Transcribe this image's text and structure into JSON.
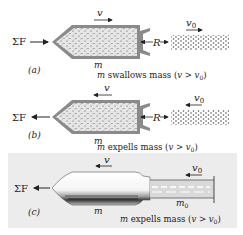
{
  "panels": [
    {
      "id": "a",
      "label": "(a)",
      "force_label": "ΣF",
      "force_direction": "right",
      "velocity_label": "v",
      "velocity_direction": "right",
      "reaction_label": "R",
      "stream_velocity_label": "v",
      "stream_velocity_sub": "0",
      "stream_velocity_direction": "right",
      "mass_label": "m",
      "caption_m": "m",
      "caption_text": " swallows mass (",
      "caption_v": "v",
      "caption_gt": " > ",
      "caption_v0": "v",
      "caption_v0_sub": "0",
      "caption_close": ")"
    },
    {
      "id": "b",
      "label": "(b)",
      "force_label": "ΣF",
      "force_direction": "left",
      "velocity_label": "v",
      "velocity_direction": "left",
      "reaction_label": "R",
      "stream_velocity_label": "v",
      "stream_velocity_sub": "0",
      "stream_velocity_direction": "left",
      "mass_label": "m",
      "caption_m": "m",
      "caption_text": " expells mass (",
      "caption_v": "v",
      "caption_gt": " > ",
      "caption_v0": "v",
      "caption_v0_sub": "0",
      "caption_close": ")"
    },
    {
      "id": "c",
      "label": "(c)",
      "force_label": "ΣF",
      "force_direction": "left",
      "velocity_label": "v",
      "velocity_direction": "left",
      "stream_velocity_label": "v",
      "stream_velocity_sub": "0",
      "stream_velocity_direction": "left",
      "mass_label": "m",
      "exhaust_mass_label": "m",
      "exhaust_mass_sub": "0",
      "caption_m": "m",
      "caption_text": " expells mass (",
      "caption_v": "v",
      "caption_gt": " > ",
      "caption_v0": "v",
      "caption_v0_sub": "0",
      "caption_close": ")"
    }
  ],
  "colors": {
    "ink": "#222222",
    "shell": "#8a8a8a",
    "fill": "#e4e4e4",
    "panel_c_bg": "#ececec",
    "particles": "#555555"
  }
}
